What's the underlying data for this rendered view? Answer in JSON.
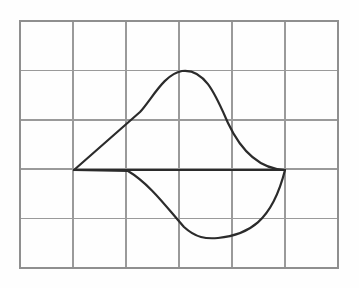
{
  "figure": {
    "background_color": "#fefefe",
    "grid": {
      "line_color": "#9a9a9a",
      "border_color": "#8f8f8f",
      "columns": 6,
      "rows": 5,
      "x_left": 20,
      "x_right": 338,
      "y_top": 21,
      "y_bottom": 268,
      "cell_width": 53,
      "cell_height": 49.4,
      "vertical_line_x": [
        20,
        73,
        126,
        179,
        232,
        285,
        338
      ],
      "horizontal_line_y": [
        21,
        70.4,
        119.8,
        169.2,
        218.6,
        268
      ]
    },
    "curve": {
      "stroke_color": "#2b2b2b",
      "stroke_width": 2.2,
      "type": "closed-region-with-chord",
      "left_vertex": {
        "x": 74,
        "y": 170
      },
      "right_vertex": {
        "x": 285,
        "y": 170
      },
      "upper_peak": {
        "x": 180,
        "y": 71
      },
      "lower_trough": {
        "x": 212,
        "y": 238
      },
      "chord_label": "horizontal chord",
      "upper_arc_path": "M 74 170 L 140 112 C 152 99 164 74 182 71 C 205 68 216 96 228 123 C 243 155 262 169 285 170",
      "lower_arc_path": "M 74 170 L 128 171 C 150 184 168 209 184 227 C 196 238 206 239 218 238 C 248 235 272 222 285 170",
      "chord_path": "M 74 170 L 285 170"
    }
  },
  "chart_data": {
    "type": "line",
    "xlabel": "",
    "ylabel": "",
    "xlim": [
      0,
      6
    ],
    "ylim": [
      0,
      5
    ],
    "grid": true,
    "legend": "none",
    "annotations": [
      "left vertex at grid intersection (1, 2)",
      "right vertex at grid intersection (5, 2)",
      "upper arc peak near (3, 4)",
      "lower arc trough near (3.6, 0.6)",
      "straight chord connects the two vertices"
    ],
    "series": [
      {
        "name": "upper-arc",
        "x": [
          1.0,
          1.36,
          1.7,
          2.0,
          2.3,
          2.6,
          3.0,
          3.3,
          3.6,
          3.9,
          4.2,
          4.6,
          5.0
        ],
        "y": [
          2.0,
          2.42,
          2.86,
          3.3,
          3.66,
          3.9,
          4.0,
          3.92,
          3.7,
          3.34,
          2.9,
          2.4,
          2.0
        ]
      },
      {
        "name": "lower-arc",
        "x": [
          1.0,
          1.4,
          1.8,
          2.1,
          2.4,
          2.8,
          3.2,
          3.6,
          4.0,
          4.4,
          4.7,
          4.9,
          5.0
        ],
        "y": [
          2.0,
          1.96,
          1.66,
          1.36,
          1.1,
          0.82,
          0.66,
          0.6,
          0.64,
          0.8,
          1.12,
          1.6,
          2.0
        ]
      },
      {
        "name": "chord",
        "x": [
          1.0,
          5.0
        ],
        "y": [
          2.0,
          2.0
        ]
      }
    ]
  }
}
